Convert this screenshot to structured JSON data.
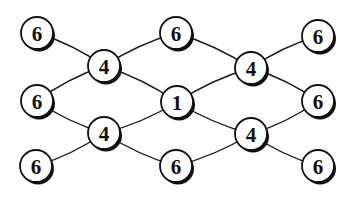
{
  "diagram": {
    "type": "graph",
    "node_radius": 16,
    "nodes": [
      {
        "id": "n1",
        "label": "6",
        "x": 37,
        "y": 33
      },
      {
        "id": "n2",
        "label": "6",
        "x": 176,
        "y": 33
      },
      {
        "id": "n3",
        "label": "6",
        "x": 318,
        "y": 36
      },
      {
        "id": "n4",
        "label": "4",
        "x": 104,
        "y": 66
      },
      {
        "id": "n5",
        "label": "4",
        "x": 251,
        "y": 68
      },
      {
        "id": "n6",
        "label": "6",
        "x": 37,
        "y": 101
      },
      {
        "id": "n7",
        "label": "1",
        "x": 177,
        "y": 102
      },
      {
        "id": "n8",
        "label": "6",
        "x": 318,
        "y": 101
      },
      {
        "id": "n9",
        "label": "4",
        "x": 104,
        "y": 133
      },
      {
        "id": "n10",
        "label": "4",
        "x": 251,
        "y": 134
      },
      {
        "id": "n11",
        "label": "6",
        "x": 36,
        "y": 166
      },
      {
        "id": "n12",
        "label": "6",
        "x": 176,
        "y": 166
      },
      {
        "id": "n13",
        "label": "6",
        "x": 318,
        "y": 166
      }
    ],
    "edges": [
      {
        "from": "n1",
        "to": "n4"
      },
      {
        "from": "n2",
        "to": "n4"
      },
      {
        "from": "n4",
        "to": "n6"
      },
      {
        "from": "n4",
        "to": "n7"
      },
      {
        "from": "n2",
        "to": "n5"
      },
      {
        "from": "n3",
        "to": "n5"
      },
      {
        "from": "n5",
        "to": "n7"
      },
      {
        "from": "n5",
        "to": "n8"
      },
      {
        "from": "n6",
        "to": "n9"
      },
      {
        "from": "n7",
        "to": "n9"
      },
      {
        "from": "n9",
        "to": "n11"
      },
      {
        "from": "n9",
        "to": "n12"
      },
      {
        "from": "n7",
        "to": "n10"
      },
      {
        "from": "n8",
        "to": "n10"
      },
      {
        "from": "n10",
        "to": "n12"
      },
      {
        "from": "n10",
        "to": "n13"
      }
    ]
  }
}
